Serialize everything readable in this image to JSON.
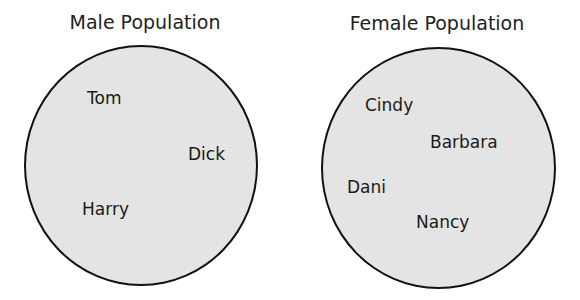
{
  "diagram": {
    "sets": [
      {
        "title": "Male Population",
        "members": [
          "Tom",
          "Dick",
          "Harry"
        ]
      },
      {
        "title": "Female Population",
        "members": [
          "Cindy",
          "Barbara",
          "Dani",
          "Nancy"
        ]
      }
    ],
    "fill_color": "#e4e4e4",
    "stroke_color": "#111111"
  }
}
